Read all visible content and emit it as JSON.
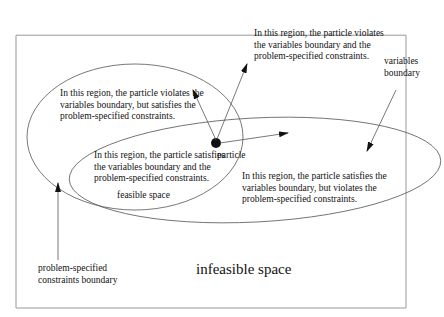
{
  "diagram": {
    "labels": {
      "top_region": [
        "In this region, the particle violates",
        "the variables boundary and the",
        "problem-specified constraints."
      ],
      "left_region": [
        "In this region, the particle violates the",
        "variables boundary, but satisfies the",
        "problem-specified constraints."
      ],
      "center_region": [
        "In this region, the particle satisfies",
        "the variables boundary and the",
        "problem-specified constraints."
      ],
      "right_region": [
        "In this region, the particle satisfies the",
        "variables boundary, but violates the",
        "problem-specified constraints."
      ],
      "variables_boundary": [
        "variables",
        "boundary"
      ],
      "problem_boundary": [
        "problem-specified",
        "constraints  boundary"
      ],
      "feasible_space": "feasible space",
      "infeasible_space": "infeasible space",
      "particle": "particle"
    },
    "colors": {
      "line": "#555555",
      "text": "#111111",
      "frame": "#999999"
    }
  }
}
